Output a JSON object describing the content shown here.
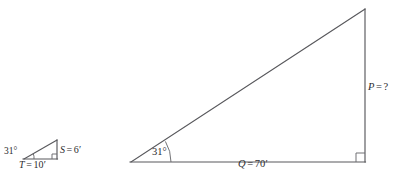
{
  "figure": {
    "background_color": "#ffffff",
    "line_color": "#58585c",
    "text_color": "#2b2b2e"
  },
  "small_triangle": {
    "name": "small-right-triangle",
    "angle": {
      "value": "31",
      "degree_symbol": "°",
      "text": "31°",
      "vertex": "left"
    },
    "vertical_side": {
      "variable": "S",
      "equals": "=",
      "value": "6",
      "prime": "′",
      "text": "S = 6′"
    },
    "horizontal_side": {
      "variable": "T",
      "equals": "=",
      "value": "10",
      "prime": "′",
      "text": "T = 10′"
    },
    "right_angle_marker": "bottom-right"
  },
  "large_triangle": {
    "name": "large-right-triangle",
    "angle": {
      "value": "31",
      "degree_symbol": "°",
      "text": "31°",
      "vertex": "left"
    },
    "vertical_side": {
      "variable": "P",
      "equals": "=",
      "value": "?",
      "text": "P = ?"
    },
    "horizontal_side": {
      "variable": "Q",
      "equals": "=",
      "value": "70",
      "prime": "′",
      "text": "Q = 70′"
    },
    "right_angle_marker": "bottom-right"
  }
}
